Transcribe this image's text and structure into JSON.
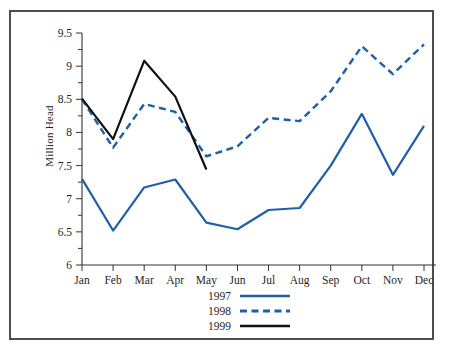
{
  "figure": {
    "ylabel": "Million Head",
    "border_color": "#4d4d4d",
    "background": "#ffffff"
  },
  "axis": {
    "y_ticks": [
      "6",
      "6.5",
      "7",
      "7.5",
      "8",
      "8.5",
      "9",
      "9.5"
    ],
    "x_ticks": [
      "Jan",
      "Feb",
      "Mar",
      "Apr",
      "May",
      "Jun",
      "Jul",
      "Aug",
      "Sep",
      "Oct",
      "Nov",
      "Dec"
    ]
  },
  "legend": {
    "entries": [
      {
        "label": "1997",
        "color": "#1f5fa9",
        "style": "solid"
      },
      {
        "label": "1998",
        "color": "#1f5fa9",
        "style": "dashed"
      },
      {
        "label": "1999",
        "color": "#111111",
        "style": "solid"
      }
    ]
  },
  "chart_data": {
    "type": "line",
    "title": "",
    "xlabel": "",
    "ylabel": "Million Head",
    "categories": [
      "Jan",
      "Feb",
      "Mar",
      "Apr",
      "May",
      "Jun",
      "Jul",
      "Aug",
      "Sep",
      "Oct",
      "Nov",
      "Dec"
    ],
    "ylim": [
      6,
      9.5
    ],
    "ytick_step": 0.5,
    "yminor_step": 0.25,
    "grid": false,
    "legend_position": "bottom-center",
    "series": [
      {
        "name": "1997",
        "color": "#1f5fa9",
        "style": "solid",
        "values": [
          7.3,
          6.52,
          7.17,
          7.29,
          6.64,
          6.54,
          6.83,
          6.86,
          7.5,
          8.28,
          7.36,
          8.1
        ]
      },
      {
        "name": "1998",
        "color": "#1f5fa9",
        "style": "dashed",
        "values": [
          8.5,
          7.77,
          8.43,
          8.31,
          7.64,
          7.79,
          8.22,
          8.17,
          8.62,
          9.3,
          8.88,
          9.33
        ]
      },
      {
        "name": "1999",
        "color": "#111111",
        "style": "solid",
        "values": [
          8.51,
          7.9,
          9.08,
          8.54,
          7.44,
          null,
          null,
          null,
          null,
          null,
          null,
          null
        ]
      }
    ]
  }
}
